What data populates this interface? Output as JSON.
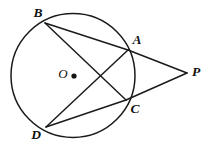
{
  "figure": {
    "width": 213,
    "height": 148,
    "background_color": "#ffffff",
    "stroke_color": "#1a1a1a"
  },
  "circle": {
    "name": "circle-O",
    "center_x": 73,
    "center_y": 75.5,
    "radius": 62,
    "center_label": "O",
    "center_label_x": 63,
    "center_label_y": 75,
    "center_dot_x": 74,
    "center_dot_y": 76,
    "center_dot_radius": 2.6
  },
  "points": [
    {
      "id": "B",
      "label": "B",
      "x": 45,
      "y": 23,
      "label_x": 38,
      "label_y": 14,
      "on_circle": true
    },
    {
      "id": "A",
      "label": "A",
      "x": 128,
      "y": 50,
      "label_x": 137,
      "label_y": 41,
      "on_circle": true
    },
    {
      "id": "C",
      "label": "C",
      "x": 126,
      "y": 100,
      "label_x": 135,
      "label_y": 110,
      "on_circle": true
    },
    {
      "id": "D",
      "label": "D",
      "x": 46,
      "y": 127,
      "label_x": 36,
      "label_y": 136,
      "on_circle": true
    },
    {
      "id": "P",
      "label": "P",
      "x": 187,
      "y": 73,
      "label_x": 196,
      "label_y": 73,
      "on_circle": false
    }
  ],
  "segments": [
    {
      "id": "BA",
      "name": "segment-b-a",
      "x1": 45,
      "y1": 23,
      "x2": 128,
      "y2": 50
    },
    {
      "id": "BC",
      "name": "segment-b-c",
      "x1": 45,
      "y1": 23,
      "x2": 126,
      "y2": 100
    },
    {
      "id": "DA",
      "name": "segment-d-a",
      "x1": 46,
      "y1": 127,
      "x2": 128,
      "y2": 50
    },
    {
      "id": "DC",
      "name": "segment-d-c",
      "x1": 46,
      "y1": 127,
      "x2": 126,
      "y2": 100
    },
    {
      "id": "AP",
      "name": "segment-a-p",
      "x1": 128,
      "y1": 50,
      "x2": 187,
      "y2": 73
    },
    {
      "id": "CP",
      "name": "segment-c-p",
      "x1": 126,
      "y1": 100,
      "x2": 187,
      "y2": 73
    }
  ]
}
